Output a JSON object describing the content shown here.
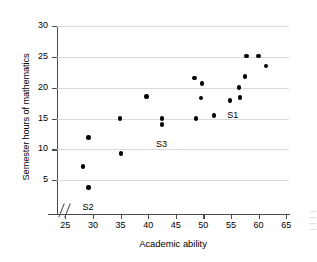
{
  "chart_data": {
    "type": "scatter",
    "title": "",
    "xlabel": "Academic ability",
    "ylabel": "Semester hours of mathematics",
    "xlim": [
      23.5,
      65.5
    ],
    "ylim": [
      0,
      30
    ],
    "xticks": [
      25,
      30,
      35,
      40,
      45,
      50,
      55,
      60,
      65
    ],
    "yticks": [
      5,
      10,
      15,
      20,
      25,
      30
    ],
    "grid": "horizontal",
    "axis_break": "x-axis broken between origin and 25",
    "legend": "none",
    "points": [
      {
        "x": 28.2,
        "y": 7.2
      },
      {
        "x": 29.2,
        "y": 11.9
      },
      {
        "x": 29.2,
        "y": 3.8
      },
      {
        "x": 34.9,
        "y": 15.0
      },
      {
        "x": 35.1,
        "y": 9.3
      },
      {
        "x": 39.7,
        "y": 18.6
      },
      {
        "x": 42.5,
        "y": 15.0
      },
      {
        "x": 42.5,
        "y": 14.0
      },
      {
        "x": 48.4,
        "y": 21.6
      },
      {
        "x": 48.7,
        "y": 15.0
      },
      {
        "x": 49.7,
        "y": 20.7
      },
      {
        "x": 49.6,
        "y": 18.3
      },
      {
        "x": 51.9,
        "y": 15.5
      },
      {
        "x": 54.8,
        "y": 17.9
      },
      {
        "x": 56.4,
        "y": 20.0
      },
      {
        "x": 56.6,
        "y": 18.4
      },
      {
        "x": 57.5,
        "y": 21.8
      },
      {
        "x": 57.8,
        "y": 25.1
      },
      {
        "x": 60.0,
        "y": 25.1
      },
      {
        "x": 61.3,
        "y": 23.5
      }
    ],
    "annotations": [
      {
        "label": "S2",
        "x": 29.2,
        "y": 3.8,
        "dx": 0,
        "dy": -13
      },
      {
        "label": "S3",
        "x": 42.5,
        "y": 14.0,
        "dx": 0,
        "dy": -13
      },
      {
        "label": "S1",
        "x": 53.4,
        "y": 16.6,
        "dx": 11,
        "dy": 0
      }
    ]
  }
}
